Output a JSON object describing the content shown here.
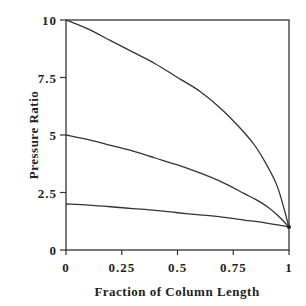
{
  "chart_data": {
    "type": "line",
    "title": "",
    "xlabel": "Fraction of Column Length",
    "ylabel": "Pressure Ratio",
    "xlim": [
      0,
      1
    ],
    "ylim": [
      0,
      10
    ],
    "xticks": [
      0,
      0.25,
      0.5,
      0.75,
      1
    ],
    "xtick_labels": [
      "0",
      "0.25",
      "0.5",
      "0.75",
      "1"
    ],
    "yticks": [
      0,
      2.5,
      5,
      7.5,
      10
    ],
    "ytick_labels": [
      "0",
      "2.5",
      "5",
      "7.5",
      "10"
    ],
    "grid": false,
    "legend": null,
    "x": [
      0,
      0.1,
      0.2,
      0.3,
      0.4,
      0.5,
      0.6,
      0.7,
      0.8,
      0.85,
      0.9,
      0.95,
      1.0
    ],
    "series": [
      {
        "name": "Inlet pressure ratio 10",
        "values": [
          10.0,
          9.6,
          9.1,
          8.6,
          8.1,
          7.5,
          6.9,
          6.1,
          5.1,
          4.5,
          3.7,
          2.7,
          1.0
        ]
      },
      {
        "name": "Inlet pressure ratio 5",
        "values": [
          5.0,
          4.8,
          4.55,
          4.3,
          4.0,
          3.7,
          3.35,
          2.95,
          2.45,
          2.2,
          1.9,
          1.5,
          1.0
        ]
      },
      {
        "name": "Inlet pressure ratio 2",
        "values": [
          2.0,
          1.95,
          1.88,
          1.8,
          1.72,
          1.62,
          1.53,
          1.43,
          1.3,
          1.24,
          1.17,
          1.09,
          1.0
        ]
      }
    ]
  }
}
